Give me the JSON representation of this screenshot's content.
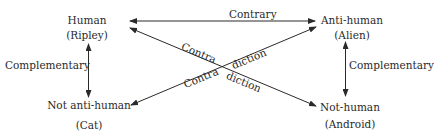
{
  "nodes": {
    "top_left": {
      "term": "Human",
      "example": "(Ripley)"
    },
    "top_right": {
      "term": "Anti-human",
      "example": "(Alien)"
    },
    "bottom_left": {
      "term": "Not anti-human",
      "example": "(Cat)"
    },
    "bottom_right": {
      "term": "Not-human",
      "example": "(Android)"
    }
  },
  "edges": {
    "top": "Contrary",
    "left": "Complementary",
    "right": "Complementary",
    "diag_part1": "Contra",
    "diag_part2": "diction"
  },
  "colors": {
    "line": "#2a2a2a",
    "text": "#2a2a2a",
    "background": "#ffffff"
  }
}
